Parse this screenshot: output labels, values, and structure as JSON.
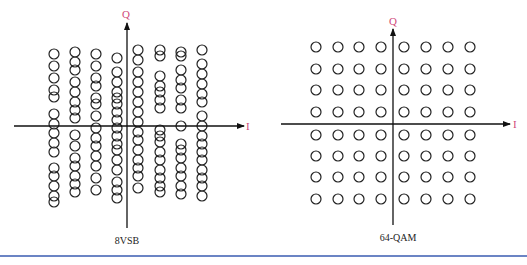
{
  "diagrams": [
    {
      "id": "8vsb",
      "caption": "8VSB",
      "axis_x_label": "I",
      "axis_y_label": "Q",
      "columns_x": [
        54,
        75,
        96,
        117,
        138,
        160,
        181,
        202
      ],
      "columns_y": [
        [
          54,
          66,
          78,
          90,
          97,
          114,
          124,
          133,
          143,
          152,
          168,
          176,
          186,
          196,
          202
        ],
        [
          52,
          62,
          70,
          82,
          92,
          102,
          110,
          118,
          135,
          146,
          158,
          166,
          176,
          184,
          192
        ],
        [
          54,
          66,
          78,
          86,
          98,
          104,
          116,
          128,
          138,
          146,
          156,
          166,
          178,
          190
        ],
        [
          58,
          72,
          82,
          92,
          98,
          104,
          112,
          120,
          128,
          136,
          144,
          150,
          160,
          170,
          182,
          190,
          198
        ],
        [
          50,
          60,
          72,
          82,
          92,
          102,
          112,
          122,
          132,
          140,
          150,
          160,
          168,
          176,
          188
        ],
        [
          50,
          56,
          76,
          86,
          92,
          100,
          108,
          130,
          136,
          142,
          152,
          160,
          170,
          178,
          186,
          192
        ],
        [
          52,
          56,
          70,
          80,
          88,
          100,
          108,
          126,
          144,
          150,
          158,
          168,
          176,
          186,
          194
        ],
        [
          50,
          64,
          74,
          84,
          94,
          102,
          116,
          126,
          136,
          144,
          152,
          160,
          170,
          178,
          186,
          196
        ]
      ],
      "colors": {
        "axis": "#111111",
        "label": "#d0497a",
        "circle": "#222222"
      }
    },
    {
      "id": "64qam",
      "caption": "64-QAM",
      "axis_x_label": "I",
      "axis_y_label": "Q",
      "grid_x": [
        316,
        338,
        359,
        381,
        404,
        426,
        448,
        470
      ],
      "grid_y": [
        47,
        69,
        90,
        112,
        135,
        156,
        177,
        199
      ],
      "colors": {
        "axis": "#111111",
        "label": "#d0497a",
        "circle": "#222222"
      }
    }
  ],
  "divider_color": "#3a5bb0"
}
